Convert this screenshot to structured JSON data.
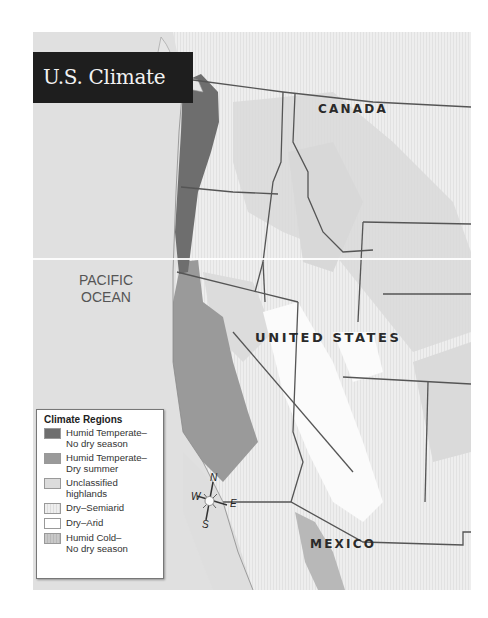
{
  "title": "U.S. Climate",
  "labels": {
    "canada": "CANADA",
    "united_states": "UNITED STATES",
    "mexico": "MEXICO",
    "pacific_line1": "PACIFIC",
    "pacific_line2": "OCEAN"
  },
  "compass": {
    "n": "N",
    "s": "S",
    "e": "E",
    "w": "W"
  },
  "legend": {
    "title": "Climate Regions",
    "items": [
      {
        "label1": "Humid Temperate–",
        "label2": "No dry season",
        "color": "#6e6e6e"
      },
      {
        "label1": "Humid Temperate–",
        "label2": "Dry summer",
        "color": "#9a9a9a"
      },
      {
        "label1": "Unclassified",
        "label2": "highlands",
        "color": "#dcdcdc"
      },
      {
        "label1": "Dry–Semiarid",
        "label2": "",
        "color": "#ececec"
      },
      {
        "label1": "Dry–Arid",
        "label2": "",
        "color": "#ffffff"
      },
      {
        "label1": "Humid Cold–",
        "label2": "No dry season",
        "color": "#c4c4c4"
      }
    ]
  },
  "colors": {
    "ocean": "#e0e0e0",
    "semiarid": "#ececec",
    "arid": "#fbfbfb",
    "highlands": "#dadada",
    "humid_no_dry": "#6e6e6e",
    "humid_dry_summer": "#9a9a9a",
    "border": "#555555",
    "title_bg": "#1e1e1e"
  }
}
